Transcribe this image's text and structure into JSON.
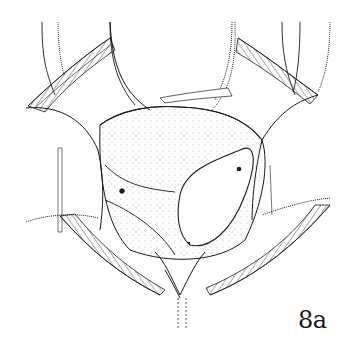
{
  "figure": {
    "label": "8a",
    "colors": {
      "background": "#ffffff",
      "ink": "#1a1a1a",
      "stipple": "#9a9a9a"
    }
  }
}
